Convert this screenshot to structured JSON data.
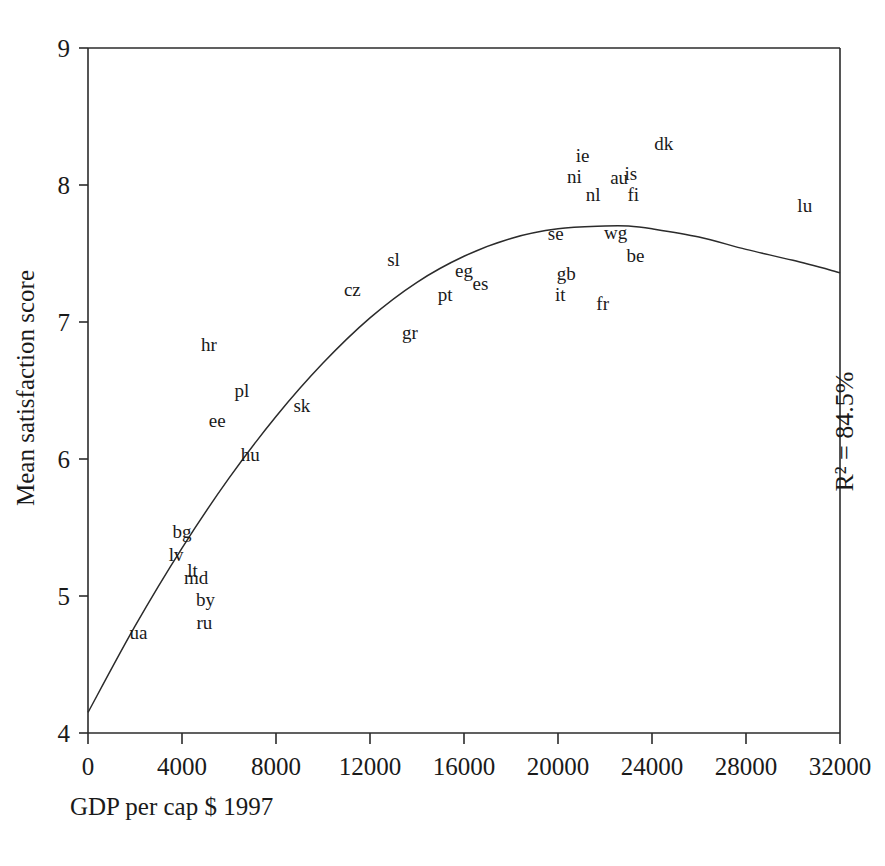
{
  "chart_data": {
    "type": "scatter",
    "title": "",
    "xlabel": "GDP per cap $ 1997",
    "ylabel": "Mean satisfaction score",
    "xlim": [
      0,
      32000
    ],
    "ylim": [
      4,
      9
    ],
    "xticks": [
      0,
      4000,
      8000,
      12000,
      16000,
      20000,
      24000,
      28000,
      32000
    ],
    "xtick_labels": [
      "0",
      "4000",
      "8000",
      "12000",
      "16000",
      "20000",
      "24000",
      "28000",
      "32000"
    ],
    "yticks": [
      4,
      5,
      6,
      7,
      8,
      9
    ],
    "ytick_labels": [
      "4",
      "5",
      "6",
      "7",
      "8",
      "9"
    ],
    "grid": false,
    "legend": false,
    "annotations": [
      {
        "name": "r-squared",
        "text": "R² = 84.5%",
        "rotation": -90,
        "x": 31700,
        "y": 6.2
      }
    ],
    "point_marker": "text-label",
    "points": [
      {
        "label": "ua",
        "x": 2150,
        "y": 4.73
      },
      {
        "label": "bg",
        "x": 4000,
        "y": 5.47
      },
      {
        "label": "lv",
        "x": 3750,
        "y": 5.3
      },
      {
        "label": "lt",
        "x": 4450,
        "y": 5.18
      },
      {
        "label": "md",
        "x": 4600,
        "y": 5.13
      },
      {
        "label": "by",
        "x": 5000,
        "y": 4.97
      },
      {
        "label": "ru",
        "x": 4950,
        "y": 4.8
      },
      {
        "label": "ee",
        "x": 5500,
        "y": 6.28
      },
      {
        "label": "hu",
        "x": 6900,
        "y": 6.03
      },
      {
        "label": "hr",
        "x": 5150,
        "y": 6.83
      },
      {
        "label": "pl",
        "x": 6550,
        "y": 6.5
      },
      {
        "label": "sk",
        "x": 9100,
        "y": 6.39
      },
      {
        "label": "cz",
        "x": 11250,
        "y": 7.23
      },
      {
        "label": "sl",
        "x": 13000,
        "y": 7.45
      },
      {
        "label": "gr",
        "x": 13700,
        "y": 6.92
      },
      {
        "label": "pt",
        "x": 15200,
        "y": 7.2
      },
      {
        "label": "eg",
        "x": 16000,
        "y": 7.37
      },
      {
        "label": "es",
        "x": 16700,
        "y": 7.28
      },
      {
        "label": "it",
        "x": 20100,
        "y": 7.2
      },
      {
        "label": "gb",
        "x": 20350,
        "y": 7.35
      },
      {
        "label": "se",
        "x": 19900,
        "y": 7.64
      },
      {
        "label": "ni",
        "x": 20700,
        "y": 8.06
      },
      {
        "label": "ie",
        "x": 21050,
        "y": 8.21
      },
      {
        "label": "nl",
        "x": 21500,
        "y": 7.93
      },
      {
        "label": "fr",
        "x": 21900,
        "y": 7.13
      },
      {
        "label": "wg",
        "x": 22450,
        "y": 7.65
      },
      {
        "label": "au",
        "x": 22600,
        "y": 8.05
      },
      {
        "label": "is",
        "x": 23100,
        "y": 8.08
      },
      {
        "label": "fi",
        "x": 23200,
        "y": 7.93
      },
      {
        "label": "be",
        "x": 23300,
        "y": 7.48
      },
      {
        "label": "dk",
        "x": 24500,
        "y": 8.3
      },
      {
        "label": "lu",
        "x": 30500,
        "y": 7.85
      }
    ],
    "fit": {
      "name": "quadratic-fit-curve",
      "description": "Fitted quadratic regression curve, peaks near 22500 at 7.70",
      "r_squared_percent": 84.5,
      "curve_points": [
        {
          "x": 0,
          "y": 4.15
        },
        {
          "x": 2000,
          "y": 4.78
        },
        {
          "x": 4000,
          "y": 5.35
        },
        {
          "x": 6000,
          "y": 5.86
        },
        {
          "x": 8000,
          "y": 6.31
        },
        {
          "x": 10000,
          "y": 6.7
        },
        {
          "x": 12000,
          "y": 7.03
        },
        {
          "x": 14000,
          "y": 7.29
        },
        {
          "x": 16000,
          "y": 7.48
        },
        {
          "x": 18000,
          "y": 7.61
        },
        {
          "x": 20000,
          "y": 7.68
        },
        {
          "x": 22000,
          "y": 7.7
        },
        {
          "x": 23000,
          "y": 7.7
        },
        {
          "x": 24000,
          "y": 7.68
        },
        {
          "x": 26000,
          "y": 7.62
        },
        {
          "x": 28000,
          "y": 7.53
        },
        {
          "x": 30000,
          "y": 7.45
        },
        {
          "x": 32000,
          "y": 7.36
        }
      ]
    }
  }
}
